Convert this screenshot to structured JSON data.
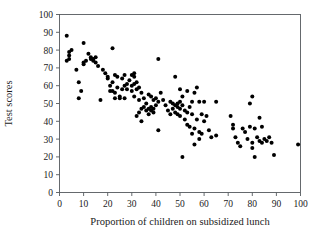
{
  "chart_data": {
    "type": "scatter",
    "title": "",
    "xlabel": "Proportion of children on subsidized lunch",
    "ylabel": "Test scores",
    "xlim": [
      0,
      100
    ],
    "ylim": [
      0,
      100
    ],
    "xticks": [
      0,
      10,
      20,
      30,
      40,
      50,
      60,
      70,
      80,
      90,
      100
    ],
    "yticks": [
      0,
      10,
      20,
      30,
      40,
      50,
      60,
      70,
      80,
      90,
      100
    ],
    "xtick_labels": [
      "0",
      "10",
      "20",
      "30",
      "40",
      "50",
      "60",
      "70",
      "80",
      "90",
      "100"
    ],
    "ytick_labels": [
      "0",
      "10",
      "20",
      "30",
      "40",
      "50",
      "60",
      "70",
      "80",
      "90",
      "100"
    ],
    "grid": false,
    "legend": null,
    "marker": "filled-circle",
    "marker_color": "#000000",
    "n_points": 139,
    "points": [
      [
        3,
        88
      ],
      [
        3,
        74
      ],
      [
        4,
        79
      ],
      [
        4,
        77
      ],
      [
        4,
        75
      ],
      [
        5,
        80
      ],
      [
        7,
        69
      ],
      [
        8,
        62
      ],
      [
        8,
        53
      ],
      [
        9,
        57
      ],
      [
        10,
        84
      ],
      [
        10,
        72
      ],
      [
        10,
        73
      ],
      [
        11,
        74
      ],
      [
        12,
        78
      ],
      [
        13,
        76
      ],
      [
        13,
        75
      ],
      [
        14,
        75
      ],
      [
        14,
        74
      ],
      [
        15,
        76
      ],
      [
        15,
        73
      ],
      [
        16,
        71
      ],
      [
        17,
        52
      ],
      [
        18,
        69
      ],
      [
        19,
        67
      ],
      [
        20,
        65
      ],
      [
        20,
        64
      ],
      [
        21,
        60
      ],
      [
        21,
        57
      ],
      [
        22,
        81
      ],
      [
        22,
        62
      ],
      [
        22,
        57
      ],
      [
        23,
        66
      ],
      [
        23,
        56
      ],
      [
        23,
        53
      ],
      [
        24,
        65
      ],
      [
        24,
        59
      ],
      [
        25,
        54
      ],
      [
        25,
        53
      ],
      [
        26,
        64
      ],
      [
        26,
        58
      ],
      [
        27,
        66
      ],
      [
        27,
        60
      ],
      [
        27,
        53
      ],
      [
        28,
        61
      ],
      [
        28,
        58
      ],
      [
        29,
        63
      ],
      [
        30,
        66
      ],
      [
        30,
        60
      ],
      [
        30,
        57
      ],
      [
        31,
        67
      ],
      [
        31,
        65
      ],
      [
        31,
        61
      ],
      [
        31,
        54
      ],
      [
        32,
        62
      ],
      [
        32,
        58
      ],
      [
        32,
        43
      ],
      [
        33,
        59
      ],
      [
        33,
        52
      ],
      [
        33,
        45
      ],
      [
        34,
        56
      ],
      [
        34,
        47
      ],
      [
        34,
        40
      ],
      [
        35,
        53
      ],
      [
        35,
        48
      ],
      [
        36,
        50
      ],
      [
        36,
        46
      ],
      [
        37,
        55
      ],
      [
        37,
        47
      ],
      [
        37,
        44
      ],
      [
        38,
        54
      ],
      [
        38,
        48
      ],
      [
        38,
        46
      ],
      [
        39,
        52
      ],
      [
        39,
        47
      ],
      [
        39,
        45
      ],
      [
        40,
        53
      ],
      [
        40,
        49
      ],
      [
        41,
        75
      ],
      [
        41,
        51
      ],
      [
        41,
        35
      ],
      [
        42,
        56
      ],
      [
        43,
        52
      ],
      [
        44,
        49
      ],
      [
        45,
        46
      ],
      [
        46,
        51
      ],
      [
        46,
        44
      ],
      [
        47,
        50
      ],
      [
        47,
        47
      ],
      [
        48,
        65
      ],
      [
        48,
        49
      ],
      [
        48,
        45
      ],
      [
        49,
        50
      ],
      [
        49,
        48
      ],
      [
        49,
        44
      ],
      [
        50,
        58
      ],
      [
        50,
        51
      ],
      [
        50,
        47
      ],
      [
        50,
        43
      ],
      [
        51,
        54
      ],
      [
        51,
        49
      ],
      [
        51,
        20
      ],
      [
        52,
        46
      ],
      [
        52,
        41
      ],
      [
        53,
        57
      ],
      [
        53,
        45
      ],
      [
        53,
        38
      ],
      [
        54,
        48
      ],
      [
        54,
        37
      ],
      [
        55,
        51
      ],
      [
        55,
        44
      ],
      [
        55,
        33
      ],
      [
        56,
        56
      ],
      [
        56,
        36
      ],
      [
        56,
        27
      ],
      [
        57,
        59
      ],
      [
        57,
        41
      ],
      [
        58,
        51
      ],
      [
        58,
        34
      ],
      [
        58,
        30
      ],
      [
        59,
        44
      ],
      [
        59,
        33
      ],
      [
        60,
        51
      ],
      [
        60,
        40
      ],
      [
        61,
        43
      ],
      [
        62,
        35
      ],
      [
        63,
        31
      ],
      [
        65,
        51
      ],
      [
        65,
        32
      ],
      [
        71,
        43
      ],
      [
        72,
        38
      ],
      [
        72,
        36
      ],
      [
        73,
        31
      ],
      [
        74,
        28
      ],
      [
        75,
        26
      ],
      [
        76,
        36
      ],
      [
        77,
        34
      ],
      [
        78,
        30
      ],
      [
        79,
        50
      ],
      [
        79,
        37
      ],
      [
        80,
        54
      ],
      [
        80,
        28
      ],
      [
        80,
        25
      ],
      [
        81,
        36
      ],
      [
        81,
        20
      ],
      [
        82,
        31
      ],
      [
        83,
        42
      ],
      [
        83,
        29
      ],
      [
        84,
        37
      ],
      [
        84,
        28
      ],
      [
        85,
        30
      ],
      [
        86,
        29
      ],
      [
        87,
        31
      ],
      [
        88,
        28
      ],
      [
        89,
        21
      ],
      [
        99,
        27
      ]
    ]
  },
  "axes": {
    "x_title": "Proportion of children on subsidized lunch",
    "y_title": "Test scores"
  }
}
